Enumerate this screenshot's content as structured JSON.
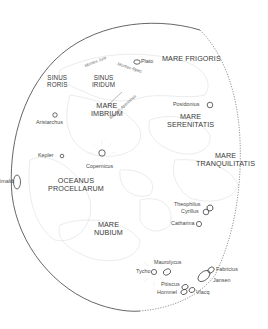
{
  "colors": {
    "limb": "#555555",
    "terminator": "#777777",
    "outline": "#e6e6e6",
    "text": "#3a3a3a",
    "crater": "#444444"
  },
  "maria": [
    {
      "id": "mare-frigoris",
      "lines": [
        "MARE FRIGORIS"
      ]
    },
    {
      "id": "sinus-roris",
      "lines": [
        "SINUS",
        "RORIS"
      ]
    },
    {
      "id": "sinus-iridum",
      "lines": [
        "SINUS",
        "IRIDUM"
      ]
    },
    {
      "id": "mare-imbrium",
      "lines": [
        "MARE",
        "IMBRIUM"
      ]
    },
    {
      "id": "mare-serenitatis",
      "lines": [
        "MARE",
        "SERENITATIS"
      ]
    },
    {
      "id": "mare-tranquilitatis",
      "lines": [
        "MARE",
        "TRANQUILITATIS"
      ]
    },
    {
      "id": "oceanus-procellarum",
      "lines": [
        "OCEANUS",
        "PROCELLARUM"
      ]
    },
    {
      "id": "mare-nubium",
      "lines": [
        "MARE",
        "NUBIUM"
      ]
    }
  ],
  "mountains": [
    {
      "id": "montes-jura",
      "label": "Montes Jura"
    },
    {
      "id": "montes-alpes",
      "label": "Montes Alpes"
    },
    {
      "id": "montes-apenninus",
      "label": "Montes Apenninus"
    }
  ],
  "craters": [
    {
      "id": "plato",
      "label": "Plato"
    },
    {
      "id": "posidonius",
      "label": "Posidonius"
    },
    {
      "id": "aristarchus",
      "label": "Aristarchus"
    },
    {
      "id": "kepler",
      "label": "Kepler"
    },
    {
      "id": "copernicus",
      "label": "Copernicus"
    },
    {
      "id": "grimaldi",
      "label": "imaldi"
    },
    {
      "id": "theophilus",
      "label": "Theophilus"
    },
    {
      "id": "cyrillus",
      "label": "Cyrillus"
    },
    {
      "id": "catharina",
      "label": "Catharina"
    },
    {
      "id": "maurolycus",
      "label": "Maurolycus"
    },
    {
      "id": "tycho",
      "label": "Tycho"
    },
    {
      "id": "pitiscus",
      "label": "Pitiscus"
    },
    {
      "id": "hommel",
      "label": "Hommel"
    },
    {
      "id": "vlacq",
      "label": "Vlacq"
    },
    {
      "id": "fabricius",
      "label": "Fabricius"
    },
    {
      "id": "jansen",
      "label": "Jansen"
    }
  ]
}
